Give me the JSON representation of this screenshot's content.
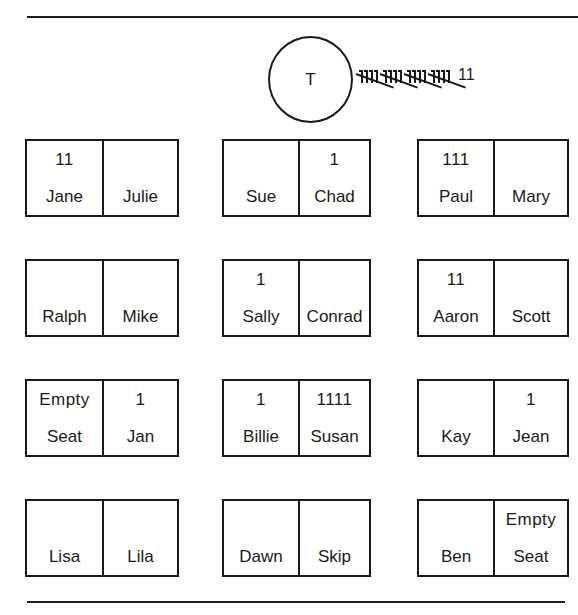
{
  "teacher": {
    "label": "T",
    "tally_groups_of_five": 4,
    "tally_remainder": "11",
    "tally_total": 22
  },
  "rows": [
    {
      "pairs": [
        {
          "seats": [
            {
              "name": "Jane",
              "tally": "11"
            },
            {
              "name": "Julie",
              "tally": ""
            }
          ]
        },
        {
          "seats": [
            {
              "name": "Sue",
              "tally": ""
            },
            {
              "name": "Chad",
              "tally": "1"
            }
          ]
        },
        {
          "seats": [
            {
              "name": "Paul",
              "tally": "111"
            },
            {
              "name": "Mary",
              "tally": ""
            }
          ]
        }
      ]
    },
    {
      "pairs": [
        {
          "seats": [
            {
              "name": "Ralph",
              "tally": ""
            },
            {
              "name": "Mike",
              "tally": ""
            }
          ]
        },
        {
          "seats": [
            {
              "name": "Sally",
              "tally": "1"
            },
            {
              "name": "Conrad",
              "tally": ""
            }
          ]
        },
        {
          "seats": [
            {
              "name": "Aaron",
              "tally": "11"
            },
            {
              "name": "Scott",
              "tally": ""
            }
          ]
        }
      ]
    },
    {
      "pairs": [
        {
          "seats": [
            {
              "name": "Seat",
              "tally": "Empty"
            },
            {
              "name": "Jan",
              "tally": "1"
            }
          ]
        },
        {
          "seats": [
            {
              "name": "Billie",
              "tally": "1"
            },
            {
              "name": "Susan",
              "tally": "1111"
            }
          ]
        },
        {
          "seats": [
            {
              "name": "Kay",
              "tally": ""
            },
            {
              "name": "Jean",
              "tally": "1"
            }
          ]
        }
      ]
    },
    {
      "pairs": [
        {
          "seats": [
            {
              "name": "Lisa",
              "tally": ""
            },
            {
              "name": "Lila",
              "tally": ""
            }
          ]
        },
        {
          "seats": [
            {
              "name": "Dawn",
              "tally": ""
            },
            {
              "name": "Skip",
              "tally": ""
            }
          ]
        },
        {
          "seats": [
            {
              "name": "Ben",
              "tally": ""
            },
            {
              "name": "Seat",
              "tally": "Empty"
            }
          ]
        }
      ]
    }
  ],
  "colors": {
    "ink": "#1a1a1a",
    "background": "#ffffff"
  }
}
